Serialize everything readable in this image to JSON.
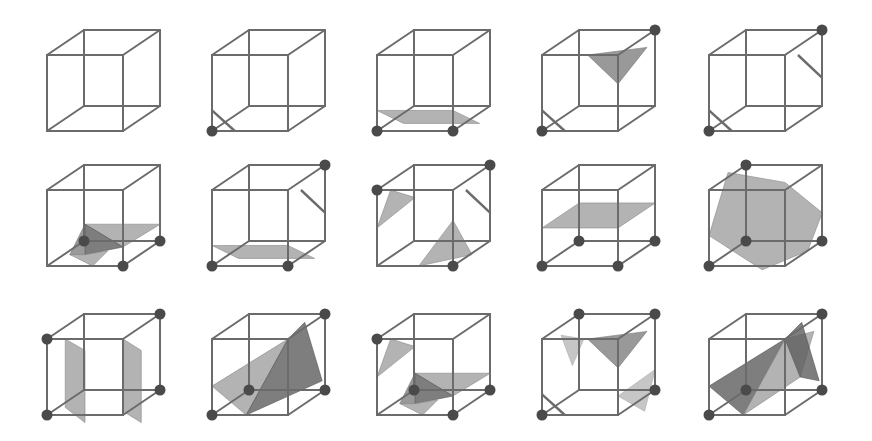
{
  "figure": {
    "background": "#ffffff",
    "colors": {
      "edge": "#6b6b6b",
      "vertex": "#4a4a4a",
      "surface_light": "#9a9a9a",
      "surface_mid": "#808080",
      "surface_dark": "#5e5e5e",
      "surface_faint": "#b8b8b8"
    },
    "grid": {
      "rows": 3,
      "cols": 5
    },
    "cube_geometry": {
      "size": 76,
      "depth_dx": 37,
      "depth_dy": -25,
      "col_x": [
        47,
        212,
        377,
        542,
        709
      ],
      "row_y": [
        55,
        190,
        339
      ]
    },
    "vertex_labels_note": "corners: 0=front-bottom-left,1=front-bottom-right,2=back-bottom-right,3=back-bottom-left,4=front-top-left,5=front-top-right,6=back-top-right,7=back-top-left",
    "cases": [
      {
        "id": 0,
        "row": 0,
        "col": 0,
        "marked_vertices": [],
        "surfaces": []
      },
      {
        "id": 1,
        "row": 0,
        "col": 1,
        "marked_vertices": [
          0
        ],
        "surfaces": [
          {
            "shade": "sliver",
            "pts": [
              [
                0,
                0.27
              ],
              [
                0.3,
                0
              ],
              [
                0.2,
                -0.1
              ]
            ]
          }
        ]
      },
      {
        "id": 2,
        "row": 0,
        "col": 2,
        "marked_vertices": [
          0,
          1
        ],
        "surfaces": [
          {
            "shade": "light",
            "pts": [
              [
                0,
                0.27
              ],
              [
                1,
                0.27
              ],
              [
                1.35,
                0.1
              ],
              [
                0.35,
                0.1
              ]
            ]
          }
        ]
      },
      {
        "id": 3,
        "row": 0,
        "col": 3,
        "marked_vertices": [
          0,
          6
        ],
        "surfaces": [
          {
            "shade": "sliver",
            "pts": [
              [
                0,
                0.27
              ],
              [
                0.3,
                0
              ],
              [
                0.2,
                -0.1
              ]
            ]
          },
          {
            "shade": "mid",
            "pts": [
              [
                0.6,
                1.0
              ],
              [
                1.38,
                1.1
              ],
              [
                1.0,
                0.62
              ]
            ]
          }
        ]
      },
      {
        "id": 4,
        "row": 0,
        "col": 4,
        "marked_vertices": [
          0,
          6
        ],
        "surfaces": [
          {
            "shade": "sliver",
            "pts": [
              [
                0,
                0.27
              ],
              [
                0.3,
                0
              ],
              [
                0.2,
                -0.1
              ]
            ]
          },
          {
            "shade": "sliver",
            "pts": [
              [
                1.17,
                1.0
              ],
              [
                1.49,
                0.7
              ],
              [
                1.39,
                0.8
              ]
            ]
          }
        ]
      },
      {
        "id": 5,
        "row": 1,
        "col": 0,
        "marked_vertices": [
          3,
          1,
          2
        ],
        "surfaces": [
          {
            "shade": "light",
            "pts": [
              [
                0.5,
                0.55
              ],
              [
                1.49,
                0.55
              ],
              [
                1.0,
                0.25
              ]
            ]
          },
          {
            "shade": "dark",
            "pts": [
              [
                0.5,
                0.55
              ],
              [
                1.0,
                0.25
              ],
              [
                0.5,
                0.15
              ]
            ]
          },
          {
            "shade": "mid",
            "pts": [
              [
                0.5,
                0.55
              ],
              [
                0.3,
                0.15
              ],
              [
                0.5,
                0.15
              ]
            ]
          },
          {
            "shade": "light",
            "pts": [
              [
                0.3,
                0.15
              ],
              [
                0.6,
                0
              ],
              [
                0.8,
                0.2
              ],
              [
                0.5,
                0.15
              ]
            ]
          }
        ]
      },
      {
        "id": 6,
        "row": 1,
        "col": 1,
        "marked_vertices": [
          0,
          1,
          6
        ],
        "surfaces": [
          {
            "shade": "light",
            "pts": [
              [
                0,
                0.27
              ],
              [
                1,
                0.27
              ],
              [
                1.35,
                0.1
              ],
              [
                0.35,
                0.1
              ]
            ]
          },
          {
            "shade": "sliver",
            "pts": [
              [
                1.17,
                1.0
              ],
              [
                1.49,
                0.7
              ],
              [
                1.39,
                0.8
              ]
            ]
          }
        ]
      },
      {
        "id": 7,
        "row": 1,
        "col": 2,
        "marked_vertices": [
          4,
          1,
          6
        ],
        "surfaces": [
          {
            "shade": "light",
            "pts": [
              [
                0.18,
                1.0
              ],
              [
                0.5,
                0.9
              ],
              [
                0,
                0.5
              ]
            ]
          },
          {
            "shade": "light",
            "pts": [
              [
                1.0,
                0.6
              ],
              [
                1.25,
                0.15
              ],
              [
                0.55,
                0.0
              ]
            ]
          },
          {
            "shade": "sliver",
            "pts": [
              [
                1.17,
                1.0
              ],
              [
                1.49,
                0.7
              ],
              [
                1.39,
                0.8
              ]
            ]
          }
        ]
      },
      {
        "id": 8,
        "row": 1,
        "col": 3,
        "marked_vertices": [
          0,
          1,
          2,
          3
        ],
        "surfaces": [
          {
            "shade": "light",
            "pts": [
              [
                0,
                0.5
              ],
              [
                1,
                0.5
              ],
              [
                1.49,
                0.83
              ],
              [
                0.49,
                0.83
              ]
            ]
          }
        ]
      },
      {
        "id": 9,
        "row": 1,
        "col": 4,
        "marked_vertices": [
          0,
          3,
          2,
          7
        ],
        "surfaces": [
          {
            "shade": "light",
            "pts": [
              [
                0.25,
                1.23
              ],
              [
                1.0,
                1.1
              ],
              [
                1.49,
                0.7
              ],
              [
                1.3,
                0.2
              ],
              [
                0.7,
                -0.05
              ],
              [
                0,
                0.4
              ]
            ]
          }
        ]
      },
      {
        "id": 10,
        "row": 2,
        "col": 0,
        "marked_vertices": [
          0,
          4,
          2,
          6
        ],
        "surfaces": [
          {
            "shade": "light",
            "pts": [
              [
                0.24,
                1.0
              ],
              [
                0.5,
                0.85
              ],
              [
                0.5,
                -0.1
              ],
              [
                0.24,
                0.1
              ]
            ]
          },
          {
            "shade": "light",
            "pts": [
              [
                1.0,
                1.0
              ],
              [
                1.24,
                0.85
              ],
              [
                1.24,
                -0.1
              ],
              [
                1.0,
                0.05
              ]
            ]
          }
        ]
      },
      {
        "id": 11,
        "row": 2,
        "col": 1,
        "marked_vertices": [
          0,
          3,
          2,
          6
        ],
        "surfaces": [
          {
            "shade": "light",
            "pts": [
              [
                0,
                0.38
              ],
              [
                1.0,
                1.0
              ],
              [
                0.45,
                0.0
              ]
            ]
          },
          {
            "shade": "dark",
            "pts": [
              [
                1.0,
                1.0
              ],
              [
                1.22,
                1.22
              ],
              [
                1.45,
                0.45
              ],
              [
                0.45,
                0.0
              ]
            ]
          }
        ]
      },
      {
        "id": 12,
        "row": 2,
        "col": 2,
        "marked_vertices": [
          4,
          3,
          1,
          2
        ],
        "surfaces": [
          {
            "shade": "light",
            "pts": [
              [
                0.18,
                1.0
              ],
              [
                0.5,
                0.9
              ],
              [
                0,
                0.5
              ]
            ]
          },
          {
            "shade": "light",
            "pts": [
              [
                0.5,
                0.55
              ],
              [
                1.49,
                0.55
              ],
              [
                1.0,
                0.25
              ]
            ]
          },
          {
            "shade": "dark",
            "pts": [
              [
                0.5,
                0.55
              ],
              [
                1.0,
                0.25
              ],
              [
                0.5,
                0.15
              ]
            ]
          },
          {
            "shade": "mid",
            "pts": [
              [
                0.5,
                0.55
              ],
              [
                0.3,
                0.15
              ],
              [
                0.5,
                0.15
              ]
            ]
          },
          {
            "shade": "light",
            "pts": [
              [
                0.3,
                0.15
              ],
              [
                0.6,
                0
              ],
              [
                0.8,
                0.2
              ],
              [
                0.5,
                0.15
              ]
            ]
          }
        ]
      },
      {
        "id": 13,
        "row": 2,
        "col": 3,
        "marked_vertices": [
          0,
          7,
          6,
          2
        ],
        "surfaces": [
          {
            "shade": "sliver",
            "pts": [
              [
                0,
                0.27
              ],
              [
                0.3,
                0
              ],
              [
                0.2,
                -0.1
              ]
            ]
          },
          {
            "shade": "faint",
            "pts": [
              [
                0.25,
                1.05
              ],
              [
                0.55,
                1.0
              ],
              [
                0.4,
                0.65
              ]
            ]
          },
          {
            "shade": "mid",
            "pts": [
              [
                0.6,
                1.0
              ],
              [
                1.38,
                1.1
              ],
              [
                1.0,
                0.62
              ]
            ]
          },
          {
            "shade": "faint",
            "pts": [
              [
                1.0,
                0.25
              ],
              [
                1.35,
                0.05
              ],
              [
                1.49,
                0.6
              ]
            ]
          }
        ]
      },
      {
        "id": 14,
        "row": 2,
        "col": 4,
        "marked_vertices": [
          0,
          3,
          2,
          6
        ],
        "surfaces": [
          {
            "shade": "dark",
            "pts": [
              [
                0,
                0.38
              ],
              [
                1.0,
                1.0
              ],
              [
                0.45,
                0.0
              ]
            ]
          },
          {
            "shade": "light",
            "pts": [
              [
                0.45,
                0.0
              ],
              [
                1.0,
                1.0
              ],
              [
                1.38,
                1.1
              ],
              [
                1.2,
                0.5
              ]
            ]
          },
          {
            "shade": "dark",
            "pts": [
              [
                1.0,
                1.0
              ],
              [
                1.22,
                1.22
              ],
              [
                1.45,
                0.45
              ],
              [
                1.2,
                0.5
              ]
            ]
          }
        ]
      }
    ]
  }
}
